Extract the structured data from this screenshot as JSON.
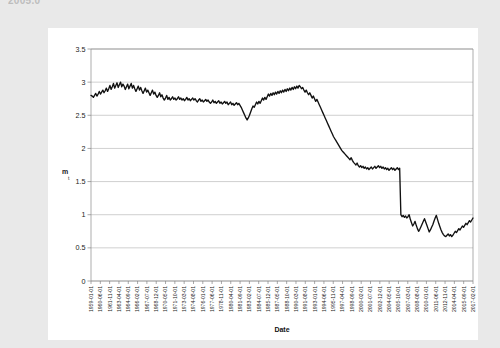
{
  "page": {
    "background_color": "#e9e9e9",
    "card_color": "#ffffff",
    "cutoff_header_text": "2005.0"
  },
  "chart_data": {
    "type": "line",
    "title": "",
    "xlabel": "Date",
    "ylabel": "m",
    "ylabel_subscript": "t",
    "ylim": [
      0,
      3.5
    ],
    "ytick_values": [
      "0",
      "0.5",
      "1",
      "1.5",
      "2",
      "2.5",
      "3",
      "3.5"
    ],
    "grid": true,
    "legend": false,
    "legend_position": "none",
    "series_color": "#111111",
    "x_tick_labels": [
      "1959-01-01",
      "1960-06-01",
      "1961-11-01",
      "1963-04-01",
      "1964-09-01",
      "1966-02-01",
      "1967-07-01",
      "1968-12-01",
      "1970-05-01",
      "1971-10-01",
      "1973-03-01",
      "1974-08-01",
      "1976-01-01",
      "1977-06-01",
      "1978-11-01",
      "1980-04-01",
      "1981-09-01",
      "1983-02-01",
      "1984-07-01",
      "1985-12-01",
      "1987-05-01",
      "1988-10-01",
      "1990-03-01",
      "1991-08-01",
      "1993-01-01",
      "1994-06-01",
      "1995-11-01",
      "1997-04-01",
      "1998-09-01",
      "2000-02-01",
      "2001-07-01",
      "2002-12-01",
      "2004-05-01",
      "2005-10-01",
      "2007-03-01",
      "2008-08-01",
      "2010-01-01",
      "2011-06-01",
      "2012-11-01",
      "2014-04-01",
      "2015-09-01",
      "2017-02-01"
    ],
    "x_range": [
      "1959-01-01",
      "2017-02-01"
    ],
    "x_tick_step_months": 17,
    "series": [
      {
        "name": "m",
        "values": [
          2.8,
          2.79,
          2.77,
          2.8,
          2.83,
          2.79,
          2.82,
          2.86,
          2.82,
          2.85,
          2.88,
          2.84,
          2.87,
          2.91,
          2.86,
          2.9,
          2.95,
          2.89,
          2.93,
          2.98,
          2.91,
          2.95,
          2.99,
          2.92,
          2.96,
          3.0,
          2.93,
          2.97,
          2.94,
          2.89,
          2.93,
          2.97,
          2.9,
          2.94,
          2.98,
          2.91,
          2.95,
          2.9,
          2.86,
          2.9,
          2.94,
          2.88,
          2.92,
          2.87,
          2.83,
          2.87,
          2.91,
          2.85,
          2.88,
          2.84,
          2.8,
          2.84,
          2.88,
          2.82,
          2.85,
          2.8,
          2.77,
          2.8,
          2.84,
          2.78,
          2.81,
          2.76,
          2.73,
          2.76,
          2.8,
          2.74,
          2.77,
          2.73,
          2.75,
          2.78,
          2.74,
          2.76,
          2.73,
          2.75,
          2.78,
          2.74,
          2.76,
          2.73,
          2.75,
          2.72,
          2.74,
          2.77,
          2.73,
          2.75,
          2.72,
          2.74,
          2.76,
          2.73,
          2.75,
          2.72,
          2.7,
          2.73,
          2.75,
          2.71,
          2.73,
          2.7,
          2.72,
          2.74,
          2.71,
          2.73,
          2.7,
          2.68,
          2.7,
          2.73,
          2.69,
          2.71,
          2.68,
          2.7,
          2.72,
          2.68,
          2.7,
          2.67,
          2.69,
          2.71,
          2.68,
          2.7,
          2.66,
          2.68,
          2.7,
          2.66,
          2.68,
          2.65,
          2.67,
          2.69,
          2.66,
          2.68,
          2.65,
          2.62,
          2.58,
          2.54,
          2.5,
          2.46,
          2.43,
          2.46,
          2.5,
          2.55,
          2.6,
          2.64,
          2.62,
          2.66,
          2.7,
          2.67,
          2.71,
          2.68,
          2.72,
          2.76,
          2.73,
          2.77,
          2.74,
          2.78,
          2.82,
          2.79,
          2.83,
          2.8,
          2.84,
          2.81,
          2.85,
          2.82,
          2.86,
          2.83,
          2.87,
          2.84,
          2.88,
          2.85,
          2.89,
          2.86,
          2.9,
          2.87,
          2.91,
          2.88,
          2.92,
          2.89,
          2.93,
          2.9,
          2.94,
          2.91,
          2.95,
          2.93,
          2.9,
          2.92,
          2.88,
          2.85,
          2.88,
          2.84,
          2.81,
          2.84,
          2.8,
          2.76,
          2.79,
          2.75,
          2.71,
          2.74,
          2.7,
          2.66,
          2.62,
          2.58,
          2.54,
          2.5,
          2.46,
          2.42,
          2.38,
          2.34,
          2.3,
          2.26,
          2.22,
          2.18,
          2.15,
          2.12,
          2.09,
          2.06,
          2.03,
          2.0,
          1.97,
          1.95,
          1.93,
          1.91,
          1.89,
          1.87,
          1.85,
          1.83,
          1.86,
          1.82,
          1.79,
          1.77,
          1.75,
          1.78,
          1.74,
          1.72,
          1.74,
          1.71,
          1.73,
          1.7,
          1.72,
          1.69,
          1.71,
          1.68,
          1.7,
          1.72,
          1.69,
          1.71,
          1.73,
          1.7,
          1.72,
          1.74,
          1.71,
          1.73,
          1.7,
          1.72,
          1.69,
          1.71,
          1.68,
          1.7,
          1.67,
          1.69,
          1.71,
          1.68,
          1.7,
          1.67,
          1.69,
          1.71,
          1.68,
          1.7,
          1.0,
          0.97,
          0.99,
          0.96,
          0.98,
          0.95,
          0.97,
          1.0,
          0.93,
          0.88,
          0.83,
          0.86,
          0.9,
          0.84,
          0.79,
          0.75,
          0.78,
          0.82,
          0.86,
          0.9,
          0.94,
          0.89,
          0.84,
          0.79,
          0.74,
          0.77,
          0.81,
          0.85,
          0.9,
          0.95,
          0.99,
          0.93,
          0.87,
          0.82,
          0.77,
          0.73,
          0.7,
          0.68,
          0.67,
          0.69,
          0.71,
          0.68,
          0.7,
          0.67,
          0.69,
          0.72,
          0.75,
          0.73,
          0.76,
          0.79,
          0.77,
          0.8,
          0.83,
          0.81,
          0.84,
          0.87,
          0.85,
          0.88,
          0.91,
          0.89,
          0.92,
          0.95
        ]
      }
    ]
  }
}
